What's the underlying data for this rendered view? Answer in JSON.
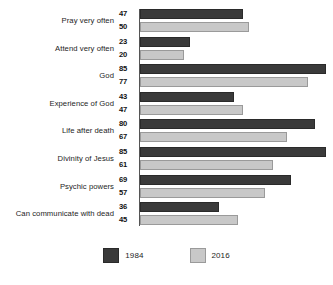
{
  "chart_data": {
    "type": "bar",
    "orientation": "horizontal",
    "title": "",
    "subtitle": "",
    "xlabel": "",
    "ylabel": "",
    "xlim": [
      0,
      85
    ],
    "grid": false,
    "legend_position": "bottom-center",
    "categories": [
      "Pray very often",
      "Attend very often",
      "God",
      "Experience of God",
      "Life after death",
      "Divinity of Jesus",
      "Psychic powers",
      "Can communicate with dead"
    ],
    "series": [
      {
        "name": "1984",
        "color": "#3a3a3a",
        "values": [
          47,
          23,
          85,
          43,
          80,
          85,
          69,
          36
        ]
      },
      {
        "name": "2016",
        "color": "#c8c8c8",
        "values": [
          50,
          20,
          77,
          47,
          67,
          61,
          57,
          45
        ]
      }
    ]
  },
  "legend": {
    "items": [
      {
        "label": "1984",
        "swatch": "dark-swatch-icon"
      },
      {
        "label": "2016",
        "swatch": "light-swatch-icon"
      }
    ]
  },
  "colors": {
    "series_1984": "#3a3a3a",
    "series_2016": "#c8c8c8",
    "axis": "#555555",
    "text": "#1d1d1d",
    "background": "#ffffff"
  }
}
